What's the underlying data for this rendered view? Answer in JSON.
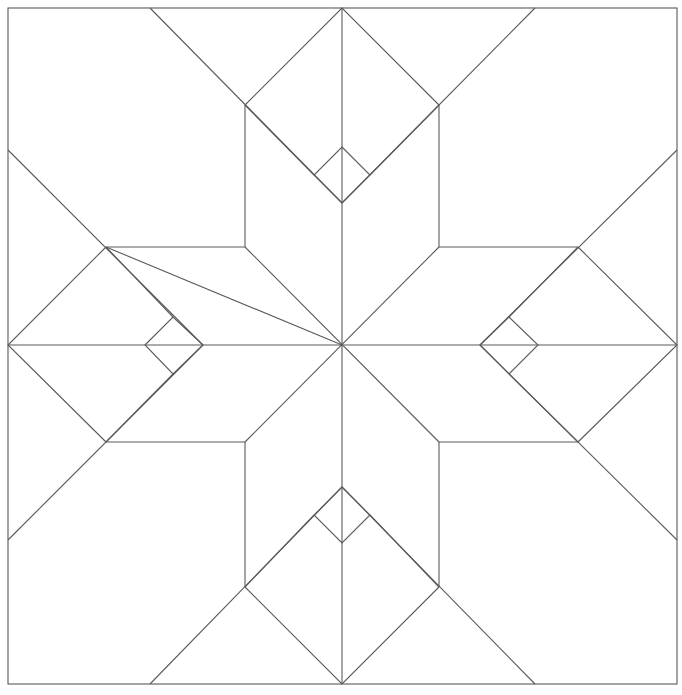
{
  "diagram": {
    "title": "",
    "type": "quilt-block-line-template",
    "pattern": "eight-point star with corner diamonds",
    "stroke_color": "#5a5a5a",
    "background_color": "#ffffff"
  }
}
